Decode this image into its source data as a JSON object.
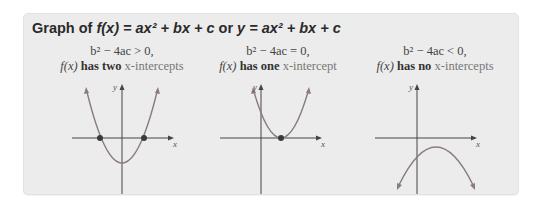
{
  "title": {
    "prefix": "Graph of ",
    "fx": "f(x)",
    "eq1": " = ax² + bx + c",
    "or": " or ",
    "y": "y",
    "eq2": " = ax² + bx + c"
  },
  "panels": [
    {
      "condition": "b² − 4ac > 0,",
      "fx": "f(x)",
      "has": " has two ",
      "xint": "x-intercepts",
      "axis_x": "x",
      "axis_y": "y"
    },
    {
      "condition": "b² − 4ac = 0,",
      "fx": "f(x)",
      "has": " has one ",
      "xint": "x-intercept",
      "axis_x": "x",
      "axis_y": "y"
    },
    {
      "condition": "b² − 4ac < 0,",
      "fx": "f(x)",
      "has": " has no ",
      "xint": "x-intercepts",
      "axis_x": "x",
      "axis_y": "y"
    }
  ],
  "colors": {
    "background": "#ececec",
    "curve": "#8a7a84",
    "axis": "#444444",
    "intercept_dot": "#3a3a3a"
  }
}
